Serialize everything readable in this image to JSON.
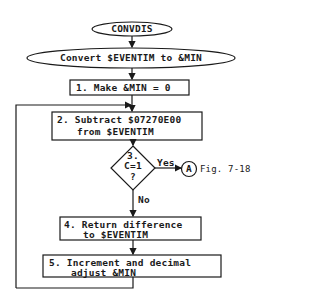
{
  "diagram": {
    "type": "flowchart",
    "start": {
      "label": "CONVDIS"
    },
    "title": {
      "label": "Convert $EVENTIM to &MIN"
    },
    "steps": [
      {
        "id": "1",
        "lines": [
          "1. Make &MIN = 0"
        ]
      },
      {
        "id": "2",
        "lines": [
          "2. Subtract $07270E00",
          "from $EVENTIM"
        ]
      },
      {
        "id": "3",
        "lines": [
          "3.",
          "C=1",
          "?"
        ],
        "yes_label": "Yes",
        "no_label": "No"
      },
      {
        "id": "4",
        "lines": [
          "4. Return difference",
          "to $EVENTIM"
        ]
      },
      {
        "id": "5",
        "lines": [
          "5. Increment and decimal",
          "adjust &MIN"
        ]
      }
    ],
    "connector": {
      "label": "A",
      "reference": "Fig. 7-18"
    },
    "colors": {
      "line": "#1a1a1a",
      "background": "#ffffff"
    }
  }
}
